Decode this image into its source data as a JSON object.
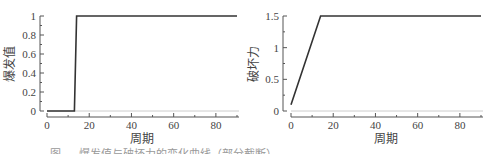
{
  "chart_data": [
    {
      "type": "line",
      "title": "",
      "xlabel": "周期",
      "ylabel": "爆发值",
      "xlim": [
        0,
        90
      ],
      "ylim": [
        0,
        1
      ],
      "xticks": [
        0,
        20,
        40,
        60,
        80
      ],
      "xticks_minor": [
        10,
        30,
        50,
        70,
        90
      ],
      "yticks": [
        0,
        0.2,
        0.4,
        0.6,
        0.8,
        1
      ],
      "ytick_labels": [
        "0",
        "0.2",
        "0.4",
        "0.6",
        "0.8",
        "1"
      ],
      "grid": false,
      "series": [
        {
          "name": "爆发值",
          "x": [
            0,
            13,
            14,
            90
          ],
          "y": [
            0,
            0,
            1,
            1
          ],
          "color": "#333333"
        }
      ],
      "reference_line": {
        "y": 0,
        "color": "#cccccc"
      }
    },
    {
      "type": "line",
      "title": "",
      "xlabel": "周期",
      "ylabel": "破坏力",
      "xlim": [
        0,
        90
      ],
      "ylim": [
        0,
        1.5
      ],
      "xticks": [
        0,
        20,
        40,
        60,
        80
      ],
      "xticks_minor": [
        10,
        30,
        50,
        70,
        90
      ],
      "yticks": [
        0,
        0.5,
        1,
        1.5
      ],
      "ytick_labels": [
        "0",
        "0.5",
        "1",
        "1.5"
      ],
      "grid": false,
      "series": [
        {
          "name": "破坏力",
          "x": [
            0,
            14,
            90
          ],
          "y": [
            0.1,
            1.5,
            1.5
          ],
          "color": "#333333"
        }
      ],
      "reference_line": {
        "y": 0,
        "color": "#cccccc"
      }
    }
  ],
  "caption": "图 — 爆发值与破坏力的变化曲线（部分截断）"
}
